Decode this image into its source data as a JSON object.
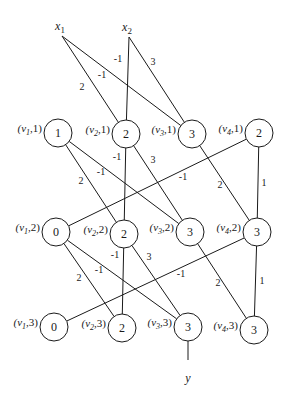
{
  "diagram": {
    "type": "layered-network",
    "inputs": [
      {
        "id": "x1",
        "label": "x",
        "sub": "1",
        "x": 62,
        "y": 36
      },
      {
        "id": "x2",
        "label": "x",
        "sub": "2",
        "x": 129,
        "y": 37
      }
    ],
    "output": {
      "id": "y",
      "label": "y",
      "from": "v3_3",
      "x": 188,
      "y": 372
    },
    "node_radius": 14,
    "nodes": [
      {
        "id": "v1_1",
        "var": "v",
        "sub": "1",
        "layer": "1",
        "value": "1",
        "x": 58,
        "y": 133
      },
      {
        "id": "v2_1",
        "var": "v",
        "sub": "2",
        "layer": "1",
        "value": "2",
        "x": 126,
        "y": 134
      },
      {
        "id": "v3_1",
        "var": "v",
        "sub": "3",
        "layer": "1",
        "value": "3",
        "x": 192,
        "y": 134
      },
      {
        "id": "v4_1",
        "var": "v",
        "sub": "4",
        "layer": "1",
        "value": "2",
        "x": 259,
        "y": 133
      },
      {
        "id": "v1_2",
        "var": "v",
        "sub": "1",
        "layer": "2",
        "value": "0",
        "x": 56,
        "y": 232
      },
      {
        "id": "v2_2",
        "var": "v",
        "sub": "2",
        "layer": "2",
        "value": "2",
        "x": 124,
        "y": 234
      },
      {
        "id": "v3_2",
        "var": "v",
        "sub": "3",
        "layer": "2",
        "value": "3",
        "x": 190,
        "y": 232
      },
      {
        "id": "v4_2",
        "var": "v",
        "sub": "4",
        "layer": "2",
        "value": "3",
        "x": 257,
        "y": 232
      },
      {
        "id": "v1_3",
        "var": "v",
        "sub": "1",
        "layer": "3",
        "value": "0",
        "x": 54,
        "y": 327
      },
      {
        "id": "v2_3",
        "var": "v",
        "sub": "2",
        "layer": "3",
        "value": "2",
        "x": 122,
        "y": 328
      },
      {
        "id": "v3_3",
        "var": "v",
        "sub": "3",
        "layer": "3",
        "value": "3",
        "x": 188,
        "y": 327
      },
      {
        "id": "v4_3",
        "var": "v",
        "sub": "4",
        "layer": "3",
        "value": "3",
        "x": 254,
        "y": 330
      }
    ],
    "edges": [
      {
        "from": "x1",
        "to": "v2_1",
        "weight": "2",
        "lx": 82,
        "ly": 90
      },
      {
        "from": "x1",
        "to": "v3_1",
        "weight": "-1",
        "lx": 102,
        "ly": 78
      },
      {
        "from": "x2",
        "to": "v2_1",
        "weight": "-1",
        "lx": 118,
        "ly": 62
      },
      {
        "from": "x2",
        "to": "v3_1",
        "weight": "3",
        "lx": 153,
        "ly": 65
      },
      {
        "from": "v1_1",
        "to": "v2_2",
        "weight": "2",
        "lx": 81,
        "ly": 184
      },
      {
        "from": "v1_1",
        "to": "v3_2",
        "weight": "-1",
        "lx": 101,
        "ly": 175
      },
      {
        "from": "v2_1",
        "to": "v2_2",
        "weight": "-1",
        "lx": 117,
        "ly": 160
      },
      {
        "from": "v2_1",
        "to": "v3_2",
        "weight": "3",
        "lx": 153,
        "ly": 163
      },
      {
        "from": "v4_1",
        "to": "v1_2",
        "weight": "-1",
        "lx": 183,
        "ly": 180
      },
      {
        "from": "v3_1",
        "to": "v4_2",
        "weight": "2",
        "lx": 220,
        "ly": 188
      },
      {
        "from": "v4_1",
        "to": "v4_2",
        "weight": "1",
        "lx": 264,
        "ly": 186
      },
      {
        "from": "v1_2",
        "to": "v2_3",
        "weight": "2",
        "lx": 79,
        "ly": 281
      },
      {
        "from": "v1_2",
        "to": "v3_3",
        "weight": "-1",
        "lx": 99,
        "ly": 273
      },
      {
        "from": "v2_2",
        "to": "v2_3",
        "weight": "-1",
        "lx": 115,
        "ly": 258
      },
      {
        "from": "v2_2",
        "to": "v3_3",
        "weight": "3",
        "lx": 149,
        "ly": 260
      },
      {
        "from": "v4_2",
        "to": "v1_3",
        "weight": "-1",
        "lx": 181,
        "ly": 277
      },
      {
        "from": "v3_2",
        "to": "v4_3",
        "weight": "2",
        "lx": 218,
        "ly": 286
      },
      {
        "from": "v4_2",
        "to": "v4_3",
        "weight": "1",
        "lx": 262,
        "ly": 284
      }
    ]
  }
}
